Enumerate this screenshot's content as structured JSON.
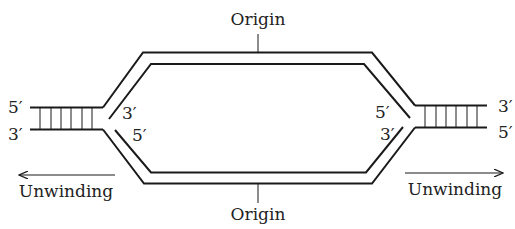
{
  "diagram": {
    "labels": {
      "origin_top": "Origin",
      "origin_bottom": "Origin",
      "unwinding_left": "Unwinding",
      "unwinding_right": "Unwinding"
    },
    "left_fork": {
      "parental_top_end": "5′",
      "parental_bottom_end": "3′",
      "daughter_top_end": "3′",
      "daughter_bottom_end": "5′"
    },
    "right_fork": {
      "parental_top_end": "3′",
      "parental_bottom_end": "5′",
      "daughter_top_end": "5′",
      "daughter_bottom_end": "3′"
    },
    "colors": {
      "stroke": "#1a1a1a",
      "text": "#222222",
      "background": "#ffffff"
    }
  }
}
